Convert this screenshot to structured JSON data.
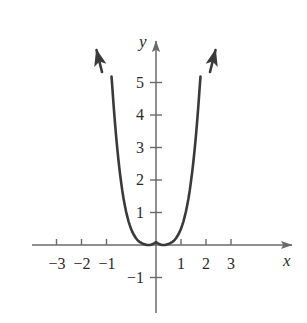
{
  "chart_data": {
    "type": "line",
    "title": "",
    "subtitle": "",
    "xlabel": "x",
    "ylabel": "y",
    "function": "y = (x^2 - 1)^2",
    "xlim": [
      -3.9,
      5.6
    ],
    "ylim": [
      -2.1,
      6.4
    ],
    "grid": false,
    "legend": null,
    "axis_style": "arrow-tipped cartesian axes through origin",
    "x_ticks": [
      -3,
      -2,
      -1,
      1,
      2,
      3
    ],
    "x_tick_labels": [
      "−3",
      "−2",
      "−1",
      "1",
      "2",
      "3"
    ],
    "y_ticks": [
      -1,
      1,
      2,
      3,
      4,
      5
    ],
    "y_tick_labels": [
      "−1",
      "1",
      "2",
      "3",
      "4",
      "5"
    ],
    "series": [
      {
        "name": "y = (x^2 - 1)^2",
        "color": "#3a3a3a",
        "x": [
          -1.78,
          -1.75,
          -1.7,
          -1.65,
          -1.6,
          -1.55,
          -1.5,
          -1.45,
          -1.4,
          -1.35,
          -1.3,
          -1.25,
          -1.2,
          -1.15,
          -1.1,
          -1.05,
          -1.0,
          -0.95,
          -0.9,
          -0.85,
          -0.8,
          -0.75,
          -0.7,
          -0.65,
          -0.6,
          -0.55,
          -0.5,
          -0.45,
          -0.4,
          -0.35,
          -0.3,
          -0.25,
          -0.2,
          -0.15,
          -0.1,
          -0.05,
          0.0,
          0.05,
          0.1,
          0.15,
          0.2,
          0.25,
          0.3,
          0.35,
          0.4,
          0.45,
          0.5,
          0.55,
          0.6,
          0.65,
          0.7,
          0.75,
          0.8,
          0.85,
          0.9,
          0.95,
          1.0,
          1.05,
          1.1,
          1.15,
          1.2,
          1.25,
          1.3,
          1.35,
          1.4,
          1.45,
          1.5,
          1.55,
          1.6,
          1.65,
          1.7,
          1.75,
          1.78
        ],
        "y": [
          5.18,
          4.88,
          4.34,
          3.84,
          3.39,
          2.97,
          2.6,
          2.26,
          1.96,
          1.68,
          1.44,
          1.23,
          1.04,
          0.88,
          0.73,
          0.61,
          0.5,
          0.41,
          0.33,
          0.27,
          0.21,
          0.16,
          0.12,
          0.09,
          0.07,
          0.05,
          0.03,
          0.02,
          0.01,
          0.0,
          0.0,
          0.0,
          0.01,
          0.02,
          0.04,
          0.06,
          0.09,
          0.06,
          0.04,
          0.02,
          0.01,
          0.0,
          0.0,
          0.0,
          0.01,
          0.02,
          0.03,
          0.05,
          0.07,
          0.09,
          0.12,
          0.16,
          0.21,
          0.27,
          0.33,
          0.41,
          0.5,
          0.61,
          0.73,
          0.88,
          1.04,
          1.23,
          1.44,
          1.68,
          1.96,
          2.26,
          2.6,
          2.97,
          3.39,
          3.84,
          4.34,
          4.88,
          5.18
        ],
        "key_points": {
          "local_maximum": [
            0,
            1
          ],
          "zeros": [
            -1,
            1
          ],
          "local_minima": [
            [
              -1,
              0
            ],
            [
              1,
              0
            ]
          ]
        },
        "end_arrows": [
          "up-left",
          "up-right"
        ]
      }
    ],
    "annotations": []
  },
  "axis_labels": {
    "x_name": "x",
    "y_name": "y"
  },
  "colors": {
    "curve": "#3a3a3a",
    "axis": "#6b6b6b",
    "text": "#2b2b2b",
    "background": "#ffffff"
  }
}
